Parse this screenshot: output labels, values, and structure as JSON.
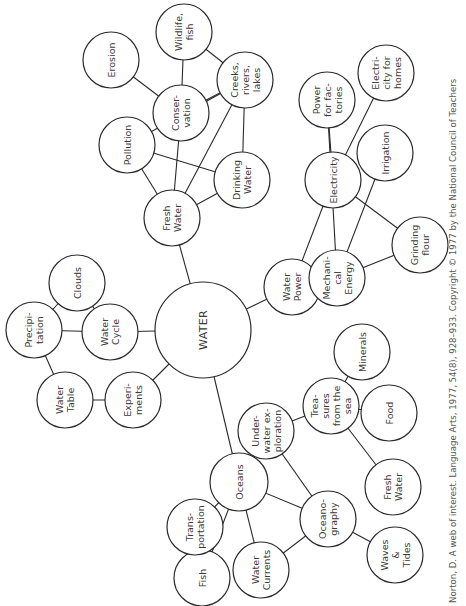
{
  "diagram": {
    "title": "WATER",
    "type": "concept web",
    "orientation": "rotated 90° clockwise",
    "caption": "Norton, D. A web of interest. Language Arts, 1977, 54(8), 928–933. Copyright © 1977 by the National Council of Teachers",
    "colors": {
      "line": "#2a2a2a",
      "text": "#3a3a3a",
      "background": "#ffffff"
    },
    "nodes": [
      {
        "id": "water",
        "lines": [
          "WATER"
        ],
        "x": 203,
        "y": 330,
        "r": 48,
        "hub": true
      },
      {
        "id": "fresh-water",
        "lines": [
          "Fresh",
          "Water"
        ],
        "x": 172,
        "y": 218,
        "r": 28
      },
      {
        "id": "pollution",
        "lines": [
          "Pollution"
        ],
        "x": 127,
        "y": 145,
        "r": 28
      },
      {
        "id": "conservation",
        "lines": [
          "Conser-",
          "vation"
        ],
        "x": 181,
        "y": 113,
        "r": 28
      },
      {
        "id": "erosion",
        "lines": [
          "Erosion"
        ],
        "x": 111,
        "y": 60,
        "r": 28
      },
      {
        "id": "wildlife-fish",
        "lines": [
          "Wildlife,",
          "fish"
        ],
        "x": 184,
        "y": 32,
        "r": 28
      },
      {
        "id": "creeks",
        "lines": [
          "Creeks,",
          "rivers,",
          "lakes"
        ],
        "x": 245,
        "y": 80,
        "r": 28
      },
      {
        "id": "drinking-water",
        "lines": [
          "Drinking",
          "Water"
        ],
        "x": 242,
        "y": 180,
        "r": 28
      },
      {
        "id": "clouds",
        "lines": [
          "Clouds"
        ],
        "x": 77,
        "y": 283,
        "r": 28
      },
      {
        "id": "precipitation",
        "lines": [
          "Precipi-",
          "tation"
        ],
        "x": 34,
        "y": 330,
        "r": 28
      },
      {
        "id": "water-cycle",
        "lines": [
          "Water",
          "Cycle"
        ],
        "x": 110,
        "y": 332,
        "r": 28
      },
      {
        "id": "water-table",
        "lines": [
          "Water",
          "Table"
        ],
        "x": 65,
        "y": 400,
        "r": 28
      },
      {
        "id": "experiments",
        "lines": [
          "Experi-",
          "ments"
        ],
        "x": 133,
        "y": 400,
        "r": 28
      },
      {
        "id": "water-power",
        "lines": [
          "Water",
          "Power"
        ],
        "x": 292,
        "y": 287,
        "r": 28
      },
      {
        "id": "electricity",
        "lines": [
          "Electricity"
        ],
        "x": 333,
        "y": 180,
        "r": 28
      },
      {
        "id": "power-factories",
        "lines": [
          "Power",
          "for fac-",
          "tories"
        ],
        "x": 327,
        "y": 100,
        "r": 28
      },
      {
        "id": "electricity-homes",
        "lines": [
          "Electri-",
          "city for",
          "homes"
        ],
        "x": 386,
        "y": 73,
        "r": 28
      },
      {
        "id": "irrigation",
        "lines": [
          "Irrigation"
        ],
        "x": 385,
        "y": 153,
        "r": 28
      },
      {
        "id": "mechanical-energy",
        "lines": [
          "Mechani-",
          "cal",
          "Energy"
        ],
        "x": 337,
        "y": 278,
        "r": 28
      },
      {
        "id": "grinding-flour",
        "lines": [
          "Grinding",
          "flour"
        ],
        "x": 420,
        "y": 245,
        "r": 28
      },
      {
        "id": "oceans",
        "lines": [
          "Oceans"
        ],
        "x": 239,
        "y": 482,
        "r": 29
      },
      {
        "id": "underwater-exploration",
        "lines": [
          "Under-",
          "water ex-",
          "ploration"
        ],
        "x": 266,
        "y": 431,
        "r": 28
      },
      {
        "id": "treasures",
        "lines": [
          "Trea-",
          "sures",
          "from the",
          "sea"
        ],
        "x": 331,
        "y": 406,
        "r": 28
      },
      {
        "id": "minerals",
        "lines": [
          "Minerals"
        ],
        "x": 362,
        "y": 352,
        "r": 28
      },
      {
        "id": "food",
        "lines": [
          "Food"
        ],
        "x": 389,
        "y": 413,
        "r": 28
      },
      {
        "id": "fresh-water-sea",
        "lines": [
          "Fresh",
          "Water"
        ],
        "x": 393,
        "y": 487,
        "r": 28
      },
      {
        "id": "oceanography",
        "lines": [
          "Oceano-",
          "graphy"
        ],
        "x": 328,
        "y": 519,
        "r": 28
      },
      {
        "id": "waves-tides",
        "lines": [
          "Waves",
          "&",
          "Tides"
        ],
        "x": 395,
        "y": 555,
        "r": 28
      },
      {
        "id": "water-currents",
        "lines": [
          "Water",
          "Currents"
        ],
        "x": 261,
        "y": 570,
        "r": 28
      },
      {
        "id": "fish",
        "lines": [
          "Fish"
        ],
        "x": 202,
        "y": 578,
        "r": 28
      },
      {
        "id": "transportation",
        "lines": [
          "Trans-",
          "portation"
        ],
        "x": 195,
        "y": 527,
        "r": 28
      }
    ],
    "edges": [
      [
        "water",
        "fresh-water"
      ],
      [
        "water",
        "water-cycle"
      ],
      [
        "water",
        "experiments"
      ],
      [
        "water",
        "water-power"
      ],
      [
        "water",
        "oceans"
      ],
      [
        "fresh-water",
        "pollution"
      ],
      [
        "fresh-water",
        "conservation"
      ],
      [
        "fresh-water",
        "creeks"
      ],
      [
        "fresh-water",
        "drinking-water"
      ],
      [
        "pollution",
        "drinking-water"
      ],
      [
        "pollution",
        "creeks"
      ],
      [
        "conservation",
        "erosion"
      ],
      [
        "conservation",
        "wildlife-fish"
      ],
      [
        "conservation",
        "creeks"
      ],
      [
        "creeks",
        "wildlife-fish"
      ],
      [
        "creeks",
        "drinking-water"
      ],
      [
        "water-cycle",
        "clouds"
      ],
      [
        "water-cycle",
        "precipitation"
      ],
      [
        "precipitation",
        "clouds"
      ],
      [
        "precipitation",
        "water-table"
      ],
      [
        "water-table",
        "experiments"
      ],
      [
        "water-power",
        "electricity"
      ],
      [
        "water-power",
        "mechanical-energy"
      ],
      [
        "electricity",
        "power-factories"
      ],
      [
        "electricity",
        "electricity-homes"
      ],
      [
        "electricity",
        "grinding-flour"
      ],
      [
        "mechanical-energy",
        "power-factories"
      ],
      [
        "mechanical-energy",
        "irrigation"
      ],
      [
        "mechanical-energy",
        "grinding-flour"
      ],
      [
        "oceans",
        "underwater-exploration"
      ],
      [
        "oceans",
        "oceanography"
      ],
      [
        "oceans",
        "water-currents"
      ],
      [
        "oceans",
        "fish"
      ],
      [
        "oceans",
        "transportation"
      ],
      [
        "underwater-exploration",
        "treasures"
      ],
      [
        "underwater-exploration",
        "oceanography"
      ],
      [
        "treasures",
        "minerals"
      ],
      [
        "treasures",
        "food"
      ],
      [
        "treasures",
        "fresh-water-sea"
      ],
      [
        "oceanography",
        "waves-tides"
      ],
      [
        "oceanography",
        "water-currents"
      ]
    ]
  }
}
